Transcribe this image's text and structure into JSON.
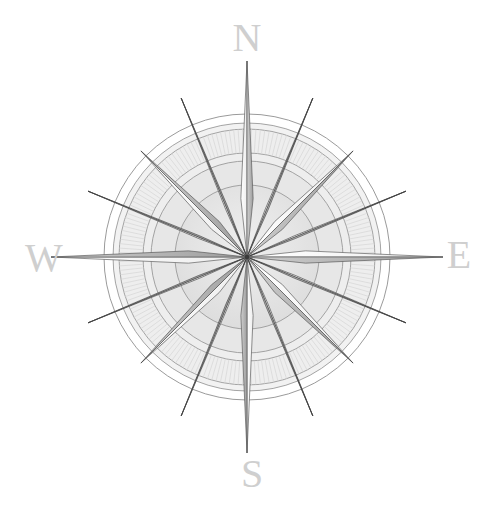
{
  "figure": {
    "name": "compass-rose",
    "background_color": "#ffffff",
    "width": 496,
    "height": 529
  },
  "compass": {
    "center": {
      "x": 247,
      "y": 257
    },
    "outer_radius": 143,
    "labels": [
      {
        "id": "north",
        "text": "N",
        "x": 247,
        "y": 42,
        "bearing_deg": 0
      },
      {
        "id": "east",
        "text": "E",
        "x": 459,
        "y": 259,
        "bearing_deg": 90
      },
      {
        "id": "south",
        "text": "S",
        "x": 252,
        "y": 478,
        "bearing_deg": 180
      },
      {
        "id": "west",
        "text": "W",
        "x": 44,
        "y": 262,
        "bearing_deg": 270
      }
    ],
    "label_color": "#cfcfcf",
    "rings": [
      {
        "id": "ring-outer-edge",
        "radius": 143,
        "stroke": "#8f8f8f",
        "fill": "none"
      },
      {
        "id": "ring-outer-band-in",
        "radius": 134,
        "stroke": "#9a9a9a",
        "fill": "#f2f2f2"
      },
      {
        "id": "ring-hatch-outer",
        "radius": 128,
        "stroke": "#9a9a9a",
        "fill": "#eeeeee"
      },
      {
        "id": "ring-hatch-inner",
        "radius": 104,
        "stroke": "#9a9a9a",
        "fill": "#eeeeee"
      },
      {
        "id": "ring-mid-band",
        "radius": 96,
        "stroke": "#9a9a9a",
        "fill": "#e7e7e7"
      },
      {
        "id": "ring-inner-disc",
        "radius": 72,
        "stroke": "#9a9a9a",
        "fill": "#e2e2e2"
      }
    ],
    "points": {
      "cardinal": {
        "count": 4,
        "bearings_deg": [
          0,
          90,
          180,
          270
        ],
        "tip_radius": 196,
        "half_width_deg": 6,
        "light_fill": "#fbfbfb",
        "dark_fill": "#b9b9b9",
        "stroke": "#555555"
      },
      "ordinal": {
        "count": 4,
        "bearings_deg": [
          45,
          135,
          225,
          315
        ],
        "tip_radius": 150,
        "half_width_deg": 7,
        "light_fill": "#fdfdfd",
        "dark_fill": "#c2c2c2",
        "stroke": "#4f4f4f"
      },
      "secondary": {
        "count": 8,
        "bearings_deg": [
          22.5,
          67.5,
          112.5,
          157.5,
          202.5,
          247.5,
          292.5,
          337.5
        ],
        "tip_radius": 172,
        "half_width_deg": 1.6,
        "light_fill": "#f7f7f7",
        "dark_fill": "#777777",
        "stroke": "#3d3d3d"
      }
    },
    "graduations": {
      "ticks": 180,
      "inner_radius": 104,
      "outer_radius": 128,
      "stroke": "#d6d6d6"
    }
  }
}
